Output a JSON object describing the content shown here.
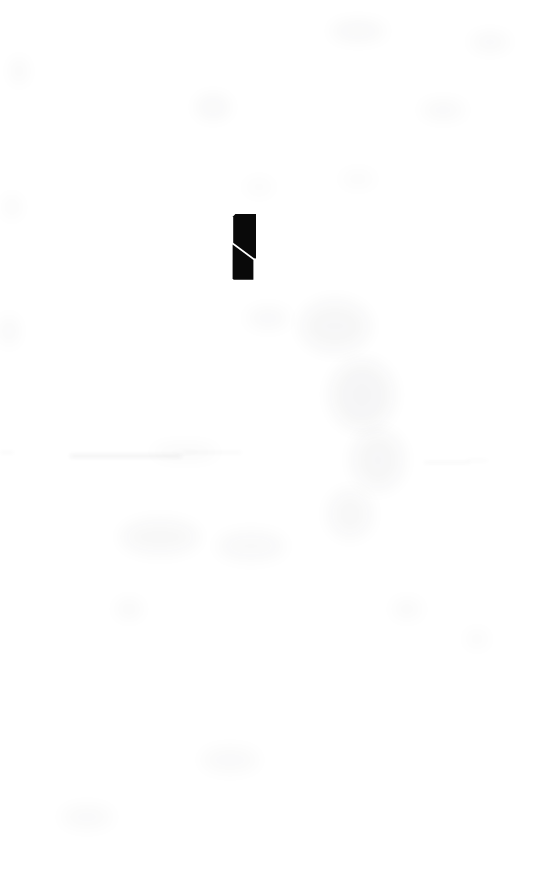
{
  "page": {
    "kind": "scanned-document-page",
    "width": 542,
    "height": 888,
    "background_color": "#ffffff",
    "visible_text": ""
  },
  "ink_mark": {
    "name": "ink-mark",
    "color": "#090909",
    "shape": "vertical-bar-with-diagonal-white-slash",
    "x": 232,
    "y": 213,
    "width": 26,
    "height": 68
  },
  "noise": {
    "color": "#2b2b33",
    "smudges": [
      {
        "x": 14,
        "y": 58,
        "w": 10,
        "h": 26,
        "opacity": 0.05
      },
      {
        "x": 6,
        "y": 196,
        "w": 12,
        "h": 22,
        "opacity": 0.045
      },
      {
        "x": 2,
        "y": 316,
        "w": 14,
        "h": 30,
        "opacity": 0.04
      },
      {
        "x": 330,
        "y": 22,
        "w": 56,
        "h": 18,
        "opacity": 0.035
      },
      {
        "x": 470,
        "y": 34,
        "w": 40,
        "h": 16,
        "opacity": 0.03
      },
      {
        "x": 196,
        "y": 96,
        "w": 34,
        "h": 22,
        "opacity": 0.035
      },
      {
        "x": 420,
        "y": 102,
        "w": 46,
        "h": 16,
        "opacity": 0.03
      },
      {
        "x": 300,
        "y": 300,
        "w": 70,
        "h": 52,
        "opacity": 0.035
      },
      {
        "x": 330,
        "y": 360,
        "w": 64,
        "h": 70,
        "opacity": 0.04
      },
      {
        "x": 352,
        "y": 430,
        "w": 52,
        "h": 60,
        "opacity": 0.035
      },
      {
        "x": 328,
        "y": 490,
        "w": 44,
        "h": 48,
        "opacity": 0.03
      },
      {
        "x": 120,
        "y": 520,
        "w": 80,
        "h": 34,
        "opacity": 0.03
      },
      {
        "x": 216,
        "y": 532,
        "w": 70,
        "h": 28,
        "opacity": 0.028
      },
      {
        "x": 116,
        "y": 600,
        "w": 26,
        "h": 18,
        "opacity": 0.03
      },
      {
        "x": 392,
        "y": 600,
        "w": 30,
        "h": 18,
        "opacity": 0.028
      },
      {
        "x": 466,
        "y": 632,
        "w": 22,
        "h": 14,
        "opacity": 0.03
      },
      {
        "x": 200,
        "y": 748,
        "w": 60,
        "h": 24,
        "opacity": 0.025
      },
      {
        "x": 60,
        "y": 806,
        "w": 54,
        "h": 22,
        "opacity": 0.025
      },
      {
        "x": 246,
        "y": 308,
        "w": 44,
        "h": 20,
        "opacity": 0.028
      },
      {
        "x": 150,
        "y": 446,
        "w": 70,
        "h": 12,
        "opacity": 0.03
      },
      {
        "x": 340,
        "y": 172,
        "w": 36,
        "h": 14,
        "opacity": 0.025
      },
      {
        "x": 244,
        "y": 180,
        "w": 30,
        "h": 14,
        "opacity": 0.022
      }
    ],
    "streaks": [
      {
        "x": 70,
        "y": 455,
        "w": 112,
        "h": 1.6,
        "opacity": 0.1
      },
      {
        "x": 182,
        "y": 452,
        "w": 60,
        "h": 1.2,
        "opacity": 0.07
      },
      {
        "x": 424,
        "y": 462,
        "w": 46,
        "h": 1.4,
        "opacity": 0.09
      },
      {
        "x": 466,
        "y": 460,
        "w": 22,
        "h": 1.1,
        "opacity": 0.06
      },
      {
        "x": 0,
        "y": 452,
        "w": 14,
        "h": 1.4,
        "opacity": 0.08
      }
    ]
  }
}
